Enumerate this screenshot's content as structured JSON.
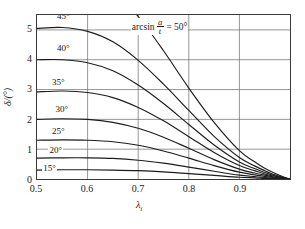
{
  "chart_data": {
    "type": "line",
    "title": "",
    "xlabel": "λᵢ",
    "xlabel_base": "λ",
    "xlabel_sub": "i",
    "ylabel": "δ/(°)",
    "xlim": [
      0.5,
      1.0
    ],
    "ylim": [
      0,
      5.5
    ],
    "xticks": [
      0.5,
      0.6,
      0.7,
      0.8,
      0.9
    ],
    "xtick_labels": [
      "0.5",
      "0.6",
      "0.7",
      "0.8",
      "0.9"
    ],
    "yticks": [
      0,
      1,
      2,
      3,
      4,
      5
    ],
    "ytick_labels": [
      "0",
      "1",
      "2",
      "3",
      "4",
      "5"
    ],
    "grid": true,
    "legend": "inline-curve-labels",
    "annotation": {
      "function": "arcsin",
      "numerator": "a",
      "denominator": "t",
      "equals": "=",
      "value": "50°",
      "full_text": "arcsin a/t = 50°"
    },
    "series": [
      {
        "name": "50°",
        "label": "50°",
        "label_shown_in_annotation": true,
        "x": [
          0.5,
          0.55,
          0.6,
          0.65,
          0.7,
          0.75,
          0.8,
          0.85,
          0.9,
          0.93,
          0.95,
          0.97,
          0.99,
          1.0
        ],
        "y": [
          7.1,
          7.05,
          6.85,
          6.35,
          5.45,
          4.3,
          3.05,
          1.9,
          0.95,
          0.58,
          0.36,
          0.19,
          0.05,
          0.0
        ]
      },
      {
        "name": "45°",
        "label": "45°",
        "x": [
          0.5,
          0.55,
          0.6,
          0.65,
          0.7,
          0.75,
          0.8,
          0.85,
          0.9,
          0.93,
          0.95,
          0.97,
          0.99,
          1.0
        ],
        "y": [
          5.05,
          5.08,
          4.95,
          4.6,
          3.98,
          3.18,
          2.3,
          1.43,
          0.72,
          0.44,
          0.28,
          0.14,
          0.04,
          0.0
        ]
      },
      {
        "name": "40°",
        "label": "40°",
        "x": [
          0.5,
          0.55,
          0.6,
          0.65,
          0.7,
          0.75,
          0.8,
          0.85,
          0.9,
          0.93,
          0.95,
          0.97,
          0.99,
          1.0
        ],
        "y": [
          4.0,
          4.0,
          3.9,
          3.63,
          3.15,
          2.53,
          1.83,
          1.14,
          0.57,
          0.35,
          0.22,
          0.11,
          0.03,
          0.0
        ]
      },
      {
        "name": "35°",
        "label": "35°",
        "x": [
          0.5,
          0.55,
          0.6,
          0.65,
          0.7,
          0.75,
          0.8,
          0.85,
          0.9,
          0.93,
          0.95,
          0.97,
          0.99,
          1.0
        ],
        "y": [
          2.92,
          2.95,
          2.9,
          2.73,
          2.4,
          1.95,
          1.42,
          0.89,
          0.45,
          0.28,
          0.17,
          0.09,
          0.02,
          0.0
        ]
      },
      {
        "name": "30°",
        "label": "30°",
        "x": [
          0.5,
          0.55,
          0.6,
          0.65,
          0.7,
          0.75,
          0.8,
          0.85,
          0.9,
          0.93,
          0.95,
          0.97,
          0.99,
          1.0
        ],
        "y": [
          2.0,
          2.02,
          2.0,
          1.9,
          1.7,
          1.4,
          1.03,
          0.65,
          0.33,
          0.2,
          0.13,
          0.06,
          0.02,
          0.0
        ]
      },
      {
        "name": "25°",
        "label": "25°",
        "x": [
          0.5,
          0.55,
          0.6,
          0.65,
          0.7,
          0.75,
          0.8,
          0.85,
          0.9,
          0.93,
          0.95,
          0.97,
          0.99,
          1.0
        ],
        "y": [
          1.3,
          1.31,
          1.3,
          1.25,
          1.13,
          0.94,
          0.7,
          0.45,
          0.23,
          0.14,
          0.09,
          0.04,
          0.01,
          0.0
        ]
      },
      {
        "name": "20°",
        "label": "20°",
        "x": [
          0.5,
          0.55,
          0.6,
          0.65,
          0.7,
          0.75,
          0.8,
          0.85,
          0.9,
          0.93,
          0.95,
          0.97,
          0.99,
          1.0
        ],
        "y": [
          0.7,
          0.71,
          0.71,
          0.69,
          0.63,
          0.53,
          0.4,
          0.26,
          0.13,
          0.08,
          0.05,
          0.03,
          0.01,
          0.0
        ]
      },
      {
        "name": "15°",
        "label": "15°",
        "x": [
          0.5,
          0.55,
          0.6,
          0.65,
          0.7,
          0.75,
          0.8,
          0.85,
          0.9,
          0.93,
          0.95,
          0.97,
          0.99,
          1.0
        ],
        "y": [
          0.3,
          0.31,
          0.31,
          0.3,
          0.28,
          0.24,
          0.18,
          0.12,
          0.06,
          0.04,
          0.02,
          0.01,
          0.0,
          0.0
        ]
      }
    ],
    "curve_label_positions": [
      {
        "label": "45°",
        "x": 0.555,
        "y": 5.42
      },
      {
        "label": "40°",
        "x": 0.555,
        "y": 4.38
      },
      {
        "label": "35°",
        "x": 0.545,
        "y": 3.25
      },
      {
        "label": "30°",
        "x": 0.552,
        "y": 2.35
      },
      {
        "label": "25°",
        "x": 0.545,
        "y": 1.62
      },
      {
        "label": "20°",
        "x": 0.54,
        "y": 1.0
      },
      {
        "label": "15°",
        "x": 0.528,
        "y": 0.4
      }
    ],
    "annotation_position": {
      "x": 0.735,
      "y": 5.2
    }
  }
}
